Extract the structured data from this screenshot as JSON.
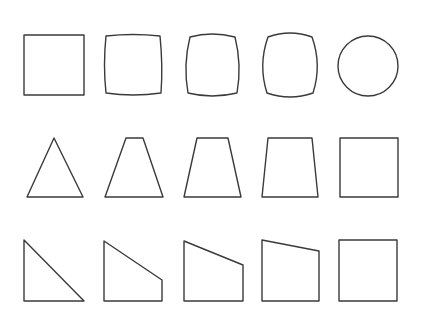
{
  "figure": {
    "stroke_color": "#3a3a3a",
    "background": "#ffffff",
    "rows": [
      {
        "name": "square-to-circle",
        "shapes": [
          {
            "name": "square",
            "type": "path",
            "d": "M24,35 L84,35 L84,95 L24,95 Z"
          },
          {
            "name": "slightly-bulged-square",
            "type": "path",
            "d": "M106,36 Q133,33 160,36 Q163,65 161,93 Q133,97 106,93 Q103,65 106,36 Z"
          },
          {
            "name": "bulged-square",
            "type": "path",
            "d": "M190,37 Q212,31 235,37 Q242,65 237,93 Q212,99 188,93 Q183,65 190,37 Z"
          },
          {
            "name": "rounded-square",
            "type": "path",
            "d": "M268,37 Q290,29 312,37 Q322,65 313,93 Q290,101 267,93 Q258,65 268,37 Z"
          },
          {
            "name": "circle",
            "type": "circle",
            "cx": 368,
            "cy": 66,
            "r": 30
          }
        ]
      },
      {
        "name": "triangle-to-square",
        "shapes": [
          {
            "name": "triangle",
            "type": "path",
            "d": "M54,138 L83,197 L27,197 Z"
          },
          {
            "name": "narrow-trapezoid",
            "type": "path",
            "d": "M126,138 L143,138 L163,197 L105,197 Z"
          },
          {
            "name": "medium-trapezoid",
            "type": "path",
            "d": "M197,138 L228,138 L241,197 L184,197 Z"
          },
          {
            "name": "wide-trapezoid",
            "type": "path",
            "d": "M268,138 L312,138 L318,197 L262,197 Z"
          },
          {
            "name": "square",
            "type": "path",
            "d": "M340,138 L398,138 L398,197 L340,197 Z"
          }
        ]
      },
      {
        "name": "right-triangle-to-square",
        "shapes": [
          {
            "name": "right-triangle",
            "type": "path",
            "d": "M24,240 L84,301 L24,301 Z"
          },
          {
            "name": "steep-quadrilateral",
            "type": "path",
            "d": "M104,241 L162,280 L162,301 L104,301 Z"
          },
          {
            "name": "medium-quadrilateral",
            "type": "path",
            "d": "M184,241 L243,265 L243,301 L184,301 Z"
          },
          {
            "name": "shallow-quadrilateral",
            "type": "path",
            "d": "M262,240 L319,251 L319,301 L262,301 Z"
          },
          {
            "name": "square",
            "type": "path",
            "d": "M339,240 L397,240 L397,301 L339,301 Z"
          }
        ]
      }
    ]
  }
}
